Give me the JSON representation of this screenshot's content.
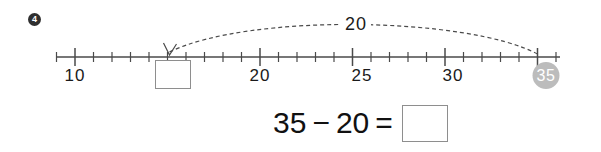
{
  "problem": {
    "number": "4"
  },
  "number_line": {
    "start_value": 10,
    "end_value": 37,
    "x_start_px": 56,
    "x_end_px": 560,
    "y_axis_px": 57,
    "pixels_per_unit": 18.5,
    "minor_tick_half_height": 5,
    "major_tick_half_height": 9,
    "axis_color": "#4a4a4a",
    "labels": [
      {
        "value": 10,
        "text": "10",
        "x": 75
      },
      {
        "value": 20,
        "text": "20",
        "x": 260
      },
      {
        "value": 25,
        "text": "25",
        "x": 362
      },
      {
        "value": 30,
        "text": "30",
        "x": 453
      },
      {
        "value": 35,
        "text": "35",
        "x": 546
      }
    ],
    "major_tick_values": [
      10,
      20,
      25,
      30,
      35
    ],
    "highlighted_endpoint": {
      "text": "35",
      "value": 35,
      "x": 546,
      "fill_color": "#bcbcbc",
      "text_color": "#ffffff"
    },
    "answer_box": {
      "value": "",
      "placeholder": "",
      "under_value": 16
    },
    "jump": {
      "label": "20",
      "from_value": 35,
      "to_value": 15,
      "direction": "left",
      "style": "dashed",
      "color": "#4a4a4a",
      "label_x": 356,
      "label_y": 24
    }
  },
  "equation": {
    "minuend": "35",
    "minus_sign": "−",
    "subtrahend": "20",
    "equals_sign": "=",
    "answer_value": "",
    "answer_placeholder": ""
  }
}
